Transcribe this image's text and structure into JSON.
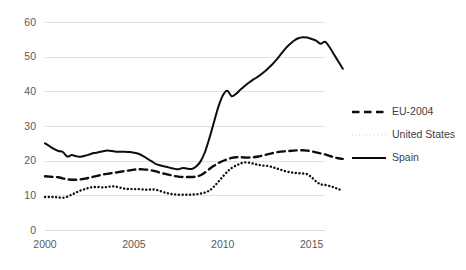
{
  "chart_data": {
    "type": "line",
    "title": "",
    "subtitle": "",
    "xlabel": "",
    "ylabel": "",
    "xlim": [
      2000,
      2015.75
    ],
    "ylim": [
      0,
      60
    ],
    "grid": true,
    "gridlines": "horizontal",
    "legend_position": "right",
    "background_color": "#ffffff",
    "gridline_color": "#e2e2e2",
    "tick_label_color": "#5a5a5a",
    "series_color": "#0d0d0d",
    "y_ticks": [
      0,
      10,
      20,
      30,
      40,
      50,
      60
    ],
    "y_tick_labels": [
      "0",
      "10",
      "20",
      "30",
      "40",
      "50",
      "60"
    ],
    "x_ticks": [
      2000,
      2005,
      2010,
      2015
    ],
    "x_tick_labels": [
      "2000",
      "2005",
      "2010",
      "2015"
    ],
    "x_step": 0.25,
    "series": [
      {
        "name": "EU-2004",
        "style": "dashed",
        "x_start": 2000,
        "values": [
          15.5,
          15.4,
          15.3,
          15.2,
          14.9,
          14.6,
          14.5,
          14.5,
          14.6,
          14.8,
          15.1,
          15.4,
          15.7,
          16.0,
          16.2,
          16.4,
          16.6,
          16.8,
          17.0,
          17.2,
          17.4,
          17.5,
          17.5,
          17.4,
          17.2,
          16.9,
          16.5,
          16.2,
          15.9,
          15.6,
          15.4,
          15.3,
          15.3,
          15.3,
          15.4,
          15.8,
          16.6,
          17.6,
          18.5,
          19.3,
          19.9,
          20.4,
          20.8,
          21.0,
          21.0,
          20.9,
          20.9,
          21.0,
          21.2,
          21.5,
          21.8,
          22.1,
          22.4,
          22.6,
          22.7,
          22.8,
          22.9,
          23.0,
          23.0,
          22.9,
          22.7,
          22.4,
          22.1,
          21.8,
          21.4,
          21.0,
          20.7,
          20.5
        ]
      },
      {
        "name": "United States",
        "style": "dotted",
        "x_start": 2000,
        "values": [
          9.5,
          9.5,
          9.5,
          9.4,
          9.3,
          9.6,
          10.2,
          10.8,
          11.4,
          11.8,
          12.2,
          12.4,
          12.4,
          12.3,
          12.4,
          12.6,
          12.5,
          12.2,
          11.9,
          11.8,
          11.8,
          11.8,
          11.7,
          11.6,
          11.7,
          11.6,
          11.2,
          10.8,
          10.5,
          10.3,
          10.2,
          10.2,
          10.2,
          10.2,
          10.3,
          10.5,
          10.8,
          11.4,
          12.5,
          13.9,
          15.4,
          16.8,
          17.9,
          18.6,
          19.2,
          19.5,
          19.4,
          19.1,
          18.8,
          18.6,
          18.5,
          18.2,
          17.8,
          17.4,
          17.0,
          16.7,
          16.5,
          16.4,
          16.3,
          16.1,
          15.2,
          14.0,
          13.2,
          13.0,
          12.7,
          12.3,
          11.8,
          11.3
        ]
      },
      {
        "name": "Spain",
        "style": "solid",
        "x_start": 2000,
        "values": [
          25.0,
          24.2,
          23.4,
          22.8,
          22.5,
          21.2,
          21.6,
          21.3,
          21.1,
          21.4,
          21.8,
          22.2,
          22.4,
          22.7,
          22.9,
          22.8,
          22.6,
          22.6,
          22.6,
          22.5,
          22.3,
          22.0,
          21.4,
          20.6,
          19.8,
          19.0,
          18.6,
          18.3,
          18.0,
          17.7,
          17.5,
          17.9,
          17.7,
          17.6,
          18.3,
          19.8,
          22.5,
          26.5,
          31.0,
          35.5,
          38.8,
          40.2,
          38.6,
          39.3,
          40.5,
          41.6,
          42.6,
          43.5,
          44.3,
          45.3,
          46.4,
          47.6,
          49.0,
          50.6,
          52.2,
          53.5,
          54.6,
          55.3,
          55.6,
          55.5,
          55.1,
          54.6,
          53.7,
          54.3,
          52.8,
          50.7,
          48.6,
          46.5
        ]
      }
    ],
    "legend": [
      {
        "label": "EU-2004",
        "style": "dashed"
      },
      {
        "label": "United States",
        "style": "dotted"
      },
      {
        "label": "Spain",
        "style": "solid"
      }
    ]
  }
}
